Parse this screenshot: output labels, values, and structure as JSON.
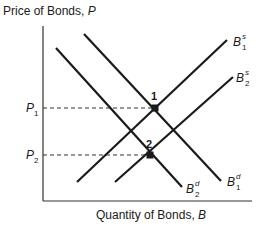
{
  "diagram": {
    "y_axis_label": "Price of Bonds, ",
    "y_axis_var": "P",
    "x_axis_label": "Quantity of Bonds, ",
    "x_axis_var": "B",
    "price_levels": [
      {
        "base": "P",
        "sub": "1"
      },
      {
        "base": "P",
        "sub": "2"
      }
    ],
    "equilibria": [
      {
        "label": "1"
      },
      {
        "label": "2"
      }
    ],
    "curves": {
      "supply_1": {
        "base": "B",
        "sub": "1",
        "sup": "s"
      },
      "supply_2": {
        "base": "B",
        "sub": "2",
        "sup": "s"
      },
      "demand_1": {
        "base": "B",
        "sub": "1",
        "sup": "d"
      },
      "demand_2": {
        "base": "B",
        "sub": "2",
        "sup": "d"
      }
    },
    "colors": {
      "line": "#1a1a1a",
      "axis": "#333333",
      "dash": "#333333"
    }
  }
}
